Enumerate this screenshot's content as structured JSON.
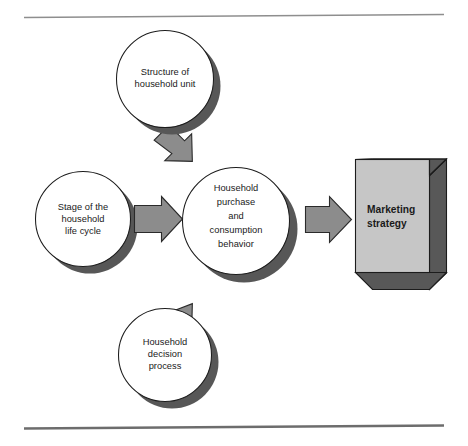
{
  "figure": {
    "background_color": "#ffffff",
    "rules": {
      "top_color": "#8e8e8e",
      "bottom_color": "#6d6d6d"
    },
    "palette": {
      "circle_fill": "#ffffff",
      "circle_outline": "#1c1c1c",
      "shadow": "#575757",
      "arrow_fill": "#8c8c8c",
      "arrow_outline": "#2a2a2a",
      "box_front": "#c6c6c6",
      "box_dark": "#585858",
      "text": "#1a1a1a"
    }
  },
  "nodes": {
    "structure": {
      "id": "structure-of-household-unit",
      "shape": "circle",
      "lines": [
        "Structure of",
        "household unit"
      ]
    },
    "stage": {
      "id": "stage-of-the-household-life-cycle",
      "shape": "circle",
      "lines": [
        "Stage of the",
        "household",
        "life cycle"
      ]
    },
    "center": {
      "id": "household-purchase-and-consumption-behavior",
      "shape": "circle",
      "lines": [
        "Household",
        "purchase",
        "and",
        "consumption",
        "behavior"
      ]
    },
    "decision": {
      "id": "household-decision-process",
      "shape": "circle",
      "lines": [
        "Household",
        "decision",
        "process"
      ]
    },
    "outcome": {
      "id": "marketing-strategy",
      "shape": "cube",
      "lines": [
        "Marketing",
        "strategy"
      ]
    }
  },
  "arrows": [
    {
      "id": "arrow-structure-to-center",
      "from": "structure",
      "to": "center",
      "direction": "down-right"
    },
    {
      "id": "arrow-stage-to-center",
      "from": "stage",
      "to": "center",
      "direction": "right"
    },
    {
      "id": "arrow-decision-to-center",
      "from": "decision",
      "to": "center",
      "direction": "up-right"
    },
    {
      "id": "arrow-center-to-outcome",
      "from": "center",
      "to": "outcome",
      "direction": "right"
    }
  ]
}
